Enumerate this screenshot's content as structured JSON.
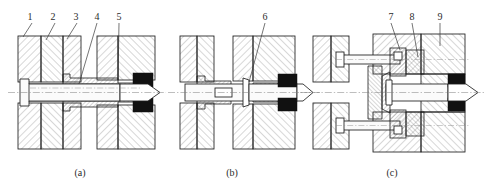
{
  "figure": {
    "background_color": "#ffffff",
    "line_color": "#1d1d1d",
    "hatch_color": "#4a4a4a",
    "seal_color": "#111111",
    "axis_color": "#8a8a8a"
  },
  "panels": [
    {
      "id": "panel-a",
      "caption": "(a)",
      "caption_x": 80,
      "caption_y": 176,
      "callouts": [
        {
          "label": "1",
          "text_x": 30,
          "text_y": 20,
          "line_x1": 32,
          "line_y1": 23,
          "line_x2": 23,
          "line_y2": 37
        },
        {
          "label": "2",
          "text_x": 53,
          "text_y": 20,
          "line_x1": 55,
          "line_y1": 23,
          "line_x2": 46,
          "line_y2": 40
        },
        {
          "label": "3",
          "text_x": 76,
          "text_y": 20,
          "line_x1": 77,
          "line_y1": 23,
          "line_x2": 67,
          "line_y2": 39
        },
        {
          "label": "4",
          "text_x": 97,
          "text_y": 20,
          "line_x1": 97,
          "line_y1": 23,
          "line_x2": 79,
          "line_y2": 84
        },
        {
          "label": "5",
          "text_x": 119,
          "text_y": 20,
          "line_x1": 119,
          "line_y1": 23,
          "line_x2": 118,
          "line_y2": 78
        }
      ]
    },
    {
      "id": "panel-b",
      "caption": "(b)",
      "caption_x": 232,
      "caption_y": 176,
      "callouts": [
        {
          "label": "6",
          "text_x": 265,
          "text_y": 20,
          "line_x1": 265,
          "line_y1": 23,
          "line_x2": 249,
          "line_y2": 82
        }
      ]
    },
    {
      "id": "panel-c",
      "caption": "(c)",
      "caption_x": 392,
      "caption_y": 176,
      "callouts": [
        {
          "label": "7",
          "text_x": 391,
          "text_y": 20,
          "line_x1": 391,
          "line_y1": 23,
          "line_x2": 400,
          "line_y2": 50
        },
        {
          "label": "8",
          "text_x": 412,
          "text_y": 20,
          "line_x1": 412,
          "line_y1": 23,
          "line_x2": 418,
          "line_y2": 57
        },
        {
          "label": "9",
          "text_x": 440,
          "text_y": 20,
          "line_x1": 440,
          "line_y1": 23,
          "line_x2": 440,
          "line_y2": 46
        }
      ]
    }
  ],
  "legend_numbers": [
    "1",
    "2",
    "3",
    "4",
    "5",
    "6",
    "7",
    "8",
    "9"
  ],
  "captions": [
    "(a)",
    "(b)",
    "(c)"
  ]
}
